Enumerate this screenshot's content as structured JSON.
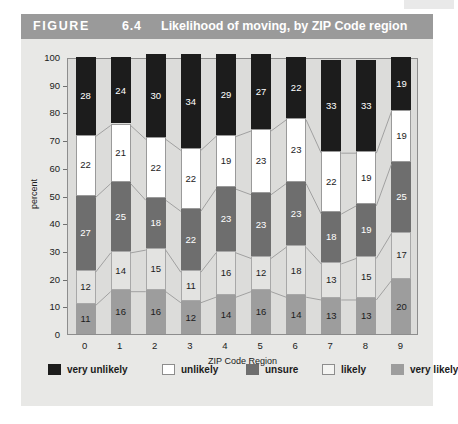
{
  "figure": {
    "label": "FIGURE",
    "number": "6.4",
    "title": "Likelihood of moving, by ZIP Code region"
  },
  "legend": {
    "items": [
      {
        "label": "very unlikely",
        "swatch_class": "sw-very-unlikely",
        "color": "#1c1c1c",
        "left": 27
      },
      {
        "label": "unlikely",
        "swatch_class": "sw-unlikely",
        "color": "#ffffff",
        "left": 141
      },
      {
        "label": "unsure",
        "swatch_class": "sw-unsure",
        "color": "#6e6e6e",
        "left": 225
      },
      {
        "label": "likely",
        "swatch_class": "sw-likely",
        "color": "#f4f4f2",
        "left": 301
      },
      {
        "label": "very likely",
        "swatch_class": "sw-very-likely",
        "color": "#9d9d9d",
        "left": 370
      }
    ]
  },
  "chart_data": {
    "type": "bar",
    "subtype": "stacked-100-percent",
    "title": "Likelihood of moving, by ZIP Code region",
    "xlabel": "ZIP Code Region",
    "ylabel": "percent",
    "ylim": [
      0,
      100
    ],
    "ytick_step": 10,
    "yticks": [
      0,
      10,
      20,
      30,
      40,
      50,
      60,
      70,
      80,
      90,
      100
    ],
    "grid": false,
    "legend_position": "bottom",
    "categories": [
      "0",
      "1",
      "2",
      "3",
      "4",
      "5",
      "6",
      "7",
      "8",
      "9"
    ],
    "stack_order_bottom_to_top": [
      "very likely",
      "likely",
      "unsure",
      "unlikely",
      "very unlikely"
    ],
    "series": [
      {
        "name": "very likely",
        "color": "#9d9d9d",
        "class": "seg-very-likely",
        "values": [
          11,
          16,
          16,
          12,
          14,
          16,
          14,
          13,
          13,
          20
        ]
      },
      {
        "name": "likely",
        "color": "#e3e3e1",
        "class": "seg-likely",
        "values": [
          12,
          14,
          15,
          11,
          16,
          12,
          18,
          13,
          15,
          17
        ]
      },
      {
        "name": "unsure",
        "color": "#6e6e6e",
        "class": "seg-unsure",
        "values": [
          27,
          25,
          18,
          22,
          23,
          23,
          23,
          18,
          19,
          25
        ]
      },
      {
        "name": "unlikely",
        "color": "#ffffff",
        "class": "seg-unlikely",
        "values": [
          22,
          21,
          22,
          22,
          19,
          23,
          23,
          22,
          19,
          19
        ]
      },
      {
        "name": "very unlikely",
        "color": "#1c1c1c",
        "class": "seg-very-unlikely",
        "values": [
          28,
          24,
          30,
          34,
          29,
          27,
          22,
          33,
          33,
          19
        ]
      }
    ]
  },
  "colors": {
    "title_bar": "#9a9a9a",
    "card_background": "#e8e8e6",
    "plot_background": "#dcdcda",
    "axis_line": "#8d8d8d",
    "text": "#1b1b1b"
  }
}
